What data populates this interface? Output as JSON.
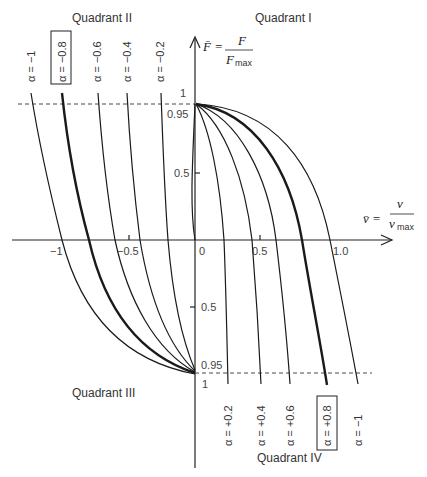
{
  "quadrants": {
    "q1": "Quadrant I",
    "q2": "Quadrant II",
    "q3": "Quadrant III",
    "q4": "Quadrant IV"
  },
  "axes": {
    "y_label_lhs": "F̄ =",
    "y_label_num": "F",
    "y_label_den": "F",
    "y_label_den_sub": "max",
    "x_label_lhs": "v̄ =",
    "x_label_num": "v",
    "x_label_den": "v",
    "x_label_den_sub": "max",
    "x_ticks": [
      "−1",
      "−0.5",
      "0",
      "0.5",
      "1.0"
    ],
    "y_ticks_top": [
      "1",
      "0.95",
      "0.5"
    ],
    "y_ticks_bottom": [
      "0.5",
      "0.95",
      "1"
    ]
  },
  "labels_top": [
    {
      "text": "α = −1",
      "boxed": false
    },
    {
      "text": "α = −0.8",
      "boxed": true
    },
    {
      "text": "α = −0.6",
      "boxed": false
    },
    {
      "text": "α = −0.4",
      "boxed": false
    },
    {
      "text": "α = −0.2",
      "boxed": false
    }
  ],
  "labels_bottom": [
    {
      "text": "α = +0.2",
      "boxed": false
    },
    {
      "text": "α = +0.4",
      "boxed": false
    },
    {
      "text": "α = +0.6",
      "boxed": false
    },
    {
      "text": "α = +0.8",
      "boxed": true
    },
    {
      "text": "α = −1",
      "boxed": false
    }
  ],
  "colors": {
    "line": "#1a1a1a",
    "background": "#ffffff"
  }
}
